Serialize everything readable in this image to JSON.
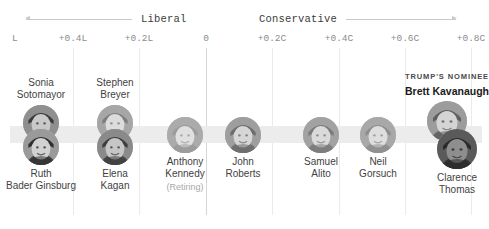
{
  "chart_data": {
    "type": "scatter",
    "title": "",
    "xlabel": "Judicial ideology score",
    "ylabel": "",
    "grid": true,
    "legend_position": "none",
    "direction_labels": [
      {
        "text": "Liberal",
        "side": "left",
        "arrow": "left"
      },
      {
        "text": "Conservative",
        "side": "right",
        "arrow": "right"
      }
    ],
    "axis_ticks": [
      {
        "label": "L",
        "x_px": 14,
        "value": -0.6,
        "truncated": true
      },
      {
        "label": "+0.4L",
        "x_px": 73,
        "value": -0.4
      },
      {
        "label": "+0.2L",
        "x_px": 139,
        "value": -0.2
      },
      {
        "label": "0",
        "x_px": 206,
        "value": 0
      },
      {
        "label": "+0.2C",
        "x_px": 272,
        "value": 0.2
      },
      {
        "label": "+0.4C",
        "x_px": 339,
        "value": 0.4
      },
      {
        "label": "+0.6C",
        "x_px": 405,
        "value": 0.6
      },
      {
        "label": "+0.8C",
        "x_px": 471,
        "value": 0.8
      }
    ],
    "gridline_positions_px": [
      73,
      139,
      206,
      272,
      339,
      405,
      471
    ],
    "zero_gridline_px": 206,
    "band": {
      "color": "#ececec",
      "left_px": 10,
      "top_px": 126,
      "width_px": 472,
      "height_px": 17
    },
    "points": [
      {
        "id": "sotomayor",
        "name_lines": [
          "Sonia",
          "Sotomayor"
        ],
        "sub": "",
        "eyebrow": "",
        "value": -0.49,
        "x_px": 41,
        "row": "upper",
        "label_position": "above",
        "circle_d": 36,
        "highlight": false
      },
      {
        "id": "ginsburg",
        "name_lines": [
          "Ruth",
          "Bader Ginsburg"
        ],
        "sub": "",
        "eyebrow": "",
        "value": -0.49,
        "x_px": 41,
        "row": "lower",
        "label_position": "below",
        "circle_d": 36,
        "highlight": false
      },
      {
        "id": "breyer",
        "name_lines": [
          "Stephen",
          "Breyer"
        ],
        "sub": "",
        "eyebrow": "",
        "value": -0.27,
        "x_px": 115,
        "row": "upper",
        "label_position": "above",
        "circle_d": 36,
        "highlight": false
      },
      {
        "id": "kagan",
        "name_lines": [
          "Elena",
          "Kagan"
        ],
        "sub": "",
        "eyebrow": "",
        "value": -0.27,
        "x_px": 115,
        "row": "lower",
        "label_position": "below",
        "circle_d": 36,
        "highlight": false
      },
      {
        "id": "kennedy",
        "name_lines": [
          "Anthony",
          "Kennedy"
        ],
        "sub": "(Retiring)",
        "eyebrow": "",
        "value": -0.06,
        "x_px": 185,
        "row": "middle",
        "label_position": "below",
        "circle_d": 36,
        "highlight": false
      },
      {
        "id": "roberts",
        "name_lines": [
          "John",
          "Roberts"
        ],
        "sub": "",
        "eyebrow": "",
        "value": 0.11,
        "x_px": 243,
        "row": "middle",
        "label_position": "below",
        "circle_d": 36,
        "highlight": false
      },
      {
        "id": "alito",
        "name_lines": [
          "Samuel",
          "Alito"
        ],
        "sub": "",
        "eyebrow": "",
        "value": 0.35,
        "x_px": 321,
        "row": "middle",
        "label_position": "below",
        "circle_d": 36,
        "highlight": false
      },
      {
        "id": "gorsuch",
        "name_lines": [
          "Neil",
          "Gorsuch"
        ],
        "sub": "",
        "eyebrow": "",
        "value": 0.52,
        "x_px": 378,
        "row": "middle",
        "label_position": "below",
        "circle_d": 36,
        "highlight": false
      },
      {
        "id": "kavanaugh",
        "name_lines": [
          "Brett Kavanaugh"
        ],
        "sub": "",
        "eyebrow": "TRUMP'S NOMINEE",
        "value": 0.73,
        "x_px": 447,
        "row": "upper",
        "label_position": "above",
        "circle_d": 40,
        "highlight": true
      },
      {
        "id": "thomas",
        "name_lines": [
          "Clarence",
          "Thomas"
        ],
        "sub": "",
        "eyebrow": "",
        "value": 0.76,
        "x_px": 457,
        "row": "lower",
        "label_position": "below",
        "circle_d": 40,
        "highlight": false
      }
    ]
  },
  "colors": {
    "band": "#ececec",
    "gridline": "#ebebeb",
    "gridline_zero": "#d6d6d6",
    "tick_text": "#8c8c8c",
    "name_text": "#3f3f3f",
    "sub_text": "#a8a8a8",
    "nominee_text": "#1a1a1a",
    "arrow_line": "#c9c9c9",
    "background": "#ffffff"
  }
}
